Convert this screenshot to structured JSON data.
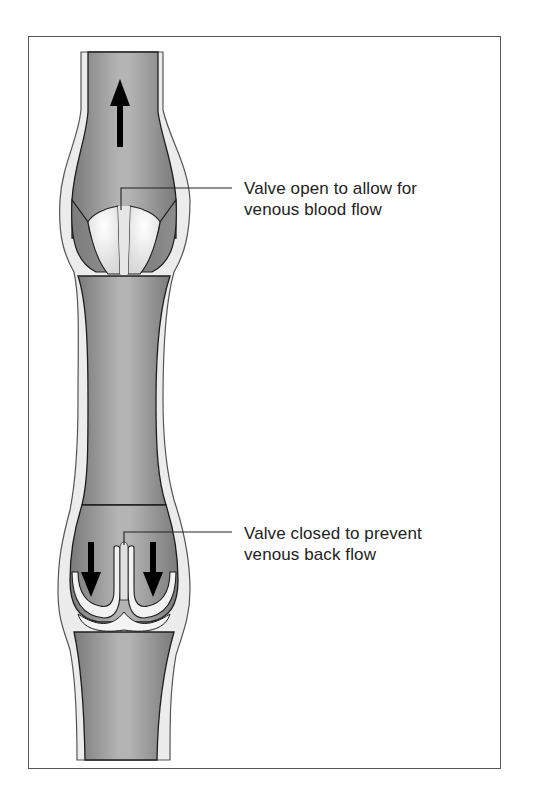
{
  "figure": {
    "colors": {
      "lumen": "#8c8c8c",
      "lumen_highlight": "#b8b8b8",
      "wall": "#ececec",
      "outline": "#1e1e1e",
      "valve_cusp": "#f2f2f2",
      "arrow": "#000000",
      "frame": "#555555",
      "text": "#222222"
    },
    "flow_arrows": [
      {
        "name": "upward-flow-arrow",
        "direction": "up"
      },
      {
        "name": "backflow-arrow-left",
        "direction": "down"
      },
      {
        "name": "backflow-arrow-right",
        "direction": "down"
      }
    ]
  },
  "labels": {
    "valve_open": {
      "line1": "Valve open to allow for",
      "line2": "venous blood flow"
    },
    "valve_closed": {
      "line1": "Valve closed to prevent",
      "line2": "venous back flow"
    }
  }
}
